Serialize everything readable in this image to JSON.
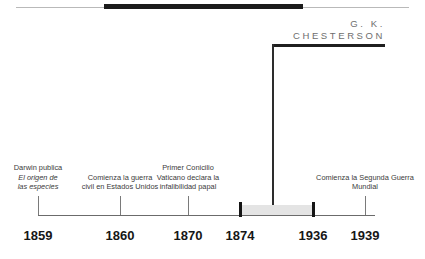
{
  "figure": {
    "kind": "historical-timeline",
    "heading": "G. K.\nCHESTERSON"
  },
  "colors": {
    "rule": "#1b1b1b",
    "axis": "#6b6b6b",
    "tick": "#151515",
    "band": "#e4e4e4",
    "heading_text": "#6e6e6e",
    "caption_text": "#3a3a3a",
    "year_text": "#161616"
  },
  "axis": {
    "years": [
      {
        "label": "1859",
        "x": 38
      },
      {
        "label": "1860",
        "x": 120
      },
      {
        "label": "1870",
        "x": 188
      },
      {
        "label": "1874",
        "x": 240
      },
      {
        "label": "1936",
        "x": 313
      },
      {
        "label": "1939",
        "x": 365
      }
    ]
  },
  "events": [
    {
      "name": "darwin-origin-of-species",
      "lines": [
        "Darwin publica"
      ],
      "italic_lines": [
        "El origen de",
        "las especies"
      ],
      "year": "1859",
      "x": 38
    },
    {
      "name": "us-civil-war-begins",
      "lines": [
        "Comienza la guerra",
        "civil en Estados Unidos"
      ],
      "italic_lines": [],
      "year": "1860",
      "x": 120
    },
    {
      "name": "first-vatican-council",
      "lines": [
        "Primer Conicilio",
        "Vaticano declara la",
        "infalibilidad papal"
      ],
      "italic_lines": [],
      "year": "1870",
      "x": 188
    },
    {
      "name": "second-world-war-begins",
      "lines": [
        "Comienza la Segunda Guerra",
        "Mundial"
      ],
      "italic_lines": [],
      "year": "1939",
      "x": 365
    }
  ],
  "period": {
    "name": "chesterson-lifespan",
    "start_year": "1874",
    "end_year": "1936",
    "start_x": 240,
    "end_x": 313
  }
}
